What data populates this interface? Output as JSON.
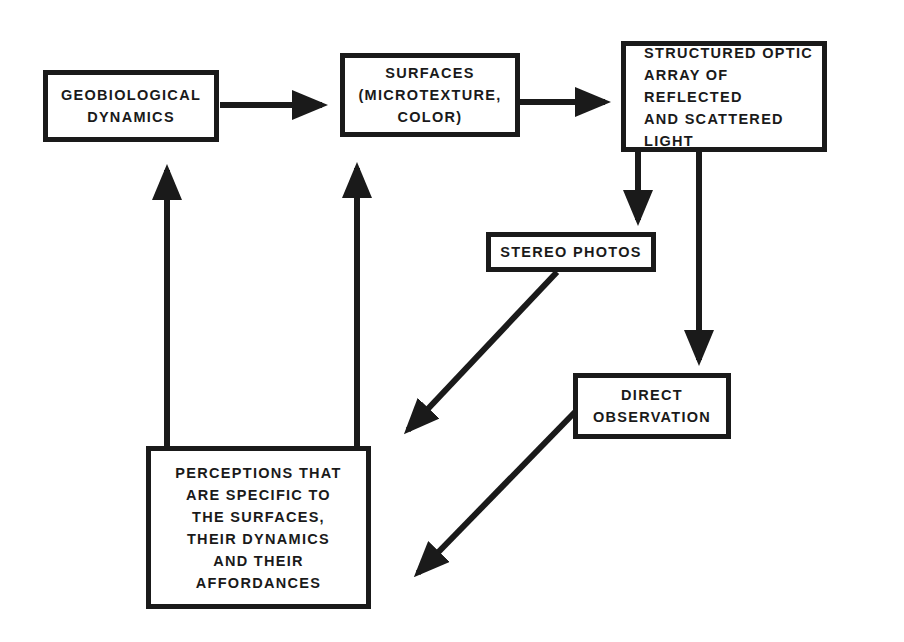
{
  "diagram": {
    "nodes": [
      {
        "id": "geobiological",
        "label": "GEOBIOLOGICAL\nDYNAMICS"
      },
      {
        "id": "surfaces",
        "label": "SURFACES\n(MICROTEXTURE,\nCOLOR)"
      },
      {
        "id": "optic-array",
        "label": "STRUCTURED OPTIC\nARRAY OF REFLECTED\nAND SCATTERED\nLIGHT"
      },
      {
        "id": "stereo-photos",
        "label": "STEREO PHOTOS"
      },
      {
        "id": "direct-observation",
        "label": "DIRECT\nOBSERVATION"
      },
      {
        "id": "perceptions",
        "label": "PERCEPTIONS THAT\nARE SPECIFIC TO\nTHE SURFACES,\nTHEIR DYNAMICS\nAND THEIR\nAFFORDANCES"
      }
    ],
    "edges": [
      {
        "from": "geobiological",
        "to": "surfaces"
      },
      {
        "from": "surfaces",
        "to": "optic-array"
      },
      {
        "from": "optic-array",
        "to": "stereo-photos"
      },
      {
        "from": "optic-array",
        "to": "direct-observation"
      },
      {
        "from": "stereo-photos",
        "to": "perceptions"
      },
      {
        "from": "direct-observation",
        "to": "perceptions"
      },
      {
        "from": "perceptions",
        "to": "geobiological"
      },
      {
        "from": "perceptions",
        "to": "surfaces"
      }
    ],
    "colors": {
      "stroke": "#1a1a1a",
      "background": "#ffffff"
    }
  }
}
